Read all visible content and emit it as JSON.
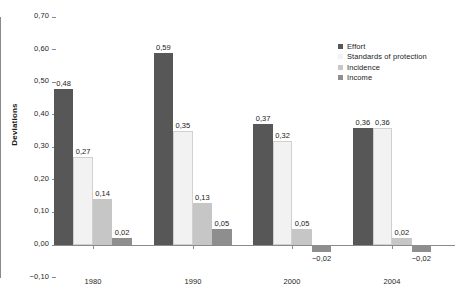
{
  "chart_data": {
    "type": "bar",
    "title": "",
    "xlabel": "",
    "ylabel": "Deviations",
    "categories": [
      "1980",
      "1990",
      "2000",
      "2004"
    ],
    "series": [
      {
        "name": "Effort",
        "color": "#575757",
        "values": [
          0.48,
          0.59,
          0.37,
          0.36
        ],
        "labels": [
          "0,48",
          "0,59",
          "0,37",
          "0,36"
        ]
      },
      {
        "name": "Standards of protection",
        "color": "#f2f2f2",
        "values": [
          0.27,
          0.35,
          0.32,
          0.36
        ],
        "labels": [
          "0,27",
          "0,35",
          "0,32",
          "0,36"
        ]
      },
      {
        "name": "Incidence",
        "color": "#c6c6c6",
        "values": [
          0.14,
          0.13,
          0.05,
          0.02
        ],
        "labels": [
          "0,14",
          "0,13",
          "0,05",
          "0,02"
        ]
      },
      {
        "name": "Income",
        "color": "#8e8e8e",
        "values": [
          0.02,
          0.05,
          -0.02,
          -0.02
        ],
        "labels": [
          "0,02",
          "0,05",
          "−0,02",
          "−0,02"
        ]
      }
    ],
    "ylim": [
      -0.1,
      0.7
    ],
    "yticks": [
      0.7,
      0.6,
      0.5,
      0.4,
      0.3,
      0.2,
      0.1,
      0.0,
      -0.1
    ],
    "ytick_labels": [
      "0,70",
      "0,60",
      "0,50",
      "0,40",
      "0,30",
      "0,20",
      "0,10",
      "0,00",
      "−0,10"
    ],
    "grid": false,
    "legend_position": "right-top",
    "decimal_separator": ","
  },
  "legend": {
    "items": [
      {
        "label": "Effort",
        "color": "#575757"
      },
      {
        "label": "Standards of protection",
        "color": "#f2f2f2"
      },
      {
        "label": "Incidence",
        "color": "#c6c6c6"
      },
      {
        "label": "Income",
        "color": "#8e8e8e"
      }
    ]
  }
}
